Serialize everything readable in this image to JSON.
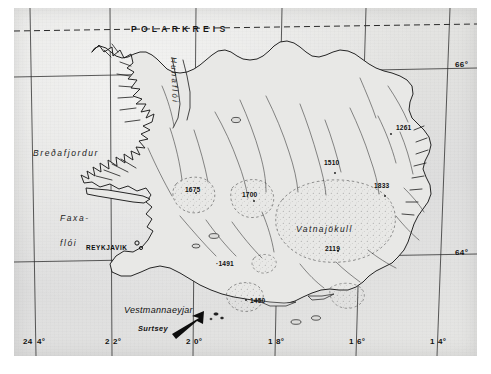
{
  "map": {
    "title": "Iceland topographic map",
    "background_color": "#e4e4e2",
    "ink_color": "#1a1a1a",
    "polar_circle_label": "POLARKREIS",
    "region_labels": [
      {
        "name": "bredafjordur",
        "text": "Breðafjordur"
      },
      {
        "name": "faxafloi-line1",
        "text": "Faxa-"
      },
      {
        "name": "faxafloi-line2",
        "text": "flói"
      },
      {
        "name": "hunafloi",
        "text": "Hunaflói"
      },
      {
        "name": "vatnajokull",
        "text": "Vatnajökull"
      }
    ],
    "city_labels": [
      {
        "name": "reykjavik",
        "text": "REYKJAVIK"
      }
    ],
    "island_labels": [
      {
        "name": "vestmannaeyjar",
        "text": "Vestmannaeyjar"
      },
      {
        "name": "surtsey",
        "text": "Surtsey"
      }
    ],
    "elevations": [
      {
        "name": "hofsjokull",
        "text": "1675"
      },
      {
        "name": "langjokull",
        "text": "1700"
      },
      {
        "name": "peak-1510",
        "text": "1510"
      },
      {
        "name": "peak-1261",
        "text": "1261"
      },
      {
        "name": "peak-1833",
        "text": "1833"
      },
      {
        "name": "hvannadalshnukur",
        "text": "2119"
      },
      {
        "name": "hekla",
        "text": "·1491"
      },
      {
        "name": "myrdalsjokull",
        "text": "1450"
      }
    ],
    "graticule": {
      "longitudes": [
        {
          "name": "lon-24",
          "left": "24",
          "right": "4°"
        },
        {
          "name": "lon-22",
          "left": "2",
          "right": "2°"
        },
        {
          "name": "lon-20",
          "left": "2",
          "right": "0°"
        },
        {
          "name": "lon-18",
          "left": "1",
          "right": "8°"
        },
        {
          "name": "lon-16",
          "left": "1",
          "right": "6°"
        },
        {
          "name": "lon-14",
          "left": "1",
          "right": "4°"
        }
      ],
      "latitudes": [
        {
          "name": "lat-66",
          "text": "66°"
        },
        {
          "name": "lat-64",
          "text": "64°"
        }
      ]
    }
  }
}
